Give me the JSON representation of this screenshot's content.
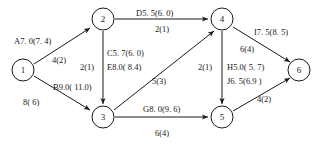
{
  "diagram": {
    "nodes": [
      {
        "id": "n1",
        "label": "1",
        "x": 23,
        "y": 70
      },
      {
        "id": "n2",
        "label": "2",
        "x": 103,
        "y": 19
      },
      {
        "id": "n3",
        "label": "3",
        "x": 103,
        "y": 117
      },
      {
        "id": "n4",
        "label": "4",
        "x": 222,
        "y": 19
      },
      {
        "id": "n5",
        "label": "5",
        "x": 222,
        "y": 117
      },
      {
        "id": "n6",
        "label": "6",
        "x": 299,
        "y": 70
      }
    ],
    "edges": [
      {
        "id": "e-1-2",
        "from": "1",
        "to": "2",
        "activity": "A",
        "duration": "7.0",
        "paren": "(7.4)",
        "cost": "4(2)"
      },
      {
        "id": "e-1-3",
        "from": "1",
        "to": "3",
        "activity": "B",
        "duration": "9.0",
        "paren": "(11.0)",
        "cost": "8( 6)"
      },
      {
        "id": "e-2-3",
        "from": "2",
        "to": "3",
        "activity": "C",
        "duration": "5.7",
        "paren": "(6.0)",
        "cost": "2(1)"
      },
      {
        "id": "e-2-4",
        "from": "2",
        "to": "4",
        "activity": "D",
        "duration": "5.5",
        "paren": "(6.0)",
        "cost": "2(1)"
      },
      {
        "id": "e-3-4",
        "from": "3",
        "to": "4",
        "activity": "E",
        "duration": "8.0",
        "paren": "(8.4)",
        "cost": "5(3)"
      },
      {
        "id": "e-3-5",
        "from": "3",
        "to": "5",
        "activity": "G",
        "duration": "8.0",
        "paren": "(9.6)",
        "cost": "6(4)"
      },
      {
        "id": "e-4-5",
        "from": "4",
        "to": "5",
        "activity": "H",
        "duration": "5.0",
        "paren": "(5.7)",
        "cost": "2(1)"
      },
      {
        "id": "e-4-6",
        "from": "4",
        "to": "6",
        "activity": "I",
        "duration": "7.5",
        "paren": "(8.5)",
        "cost": "6(4)"
      },
      {
        "id": "e-5-6",
        "from": "5",
        "to": "6",
        "activity": "J",
        "duration": "6.5",
        "paren": "(6.9)",
        "cost": "4(2)"
      }
    ],
    "labels": {
      "a_main": "A7. 0(7. 4)",
      "a_cost": "4(2)",
      "b_main": "B9.0( 11.0)",
      "b_cost": "8( 6)",
      "c_main": "C5. 7(6. 0)",
      "c_cost": "2(1)",
      "d_main": "D5. 5(6. 0)",
      "d_cost": "2(1)",
      "e_main": "E8.0( 8.4)",
      "e_cost": "5(3)",
      "g_main": "G8. 0(9. 6)",
      "g_cost": "6(4)",
      "h_main": "H5.0( 5. 7)",
      "h_cost": "2(1)",
      "i_main": "I7. 5(8. 5)",
      "i_cost": "6(4)",
      "j_main": "J6. 5(6.9 )",
      "j_cost": "4(2)"
    },
    "colors": {
      "ink": "#1a1a1a",
      "paper": "#ffffff"
    }
  }
}
